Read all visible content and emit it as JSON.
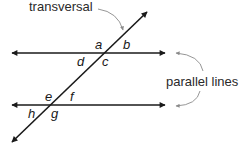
{
  "diagram": {
    "title_labels": {
      "transversal": "transversal",
      "parallel_lines": "parallel lines"
    },
    "angles": {
      "top": [
        "a",
        "b",
        "c",
        "d"
      ],
      "bottom": [
        "e",
        "f",
        "g",
        "h"
      ],
      "a": "a",
      "b": "b",
      "c": "c",
      "d": "d",
      "e": "e",
      "f": "f",
      "g": "g",
      "h": "h"
    },
    "colors": {
      "line": "#1a1a1a",
      "pointer": "#8a8a8a",
      "text": "#2a2a2a"
    }
  }
}
